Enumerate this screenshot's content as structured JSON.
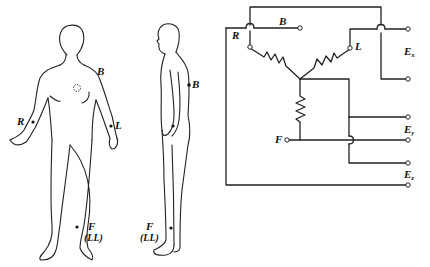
{
  "figure": {
    "front_view": {
      "labels": {
        "right_arm": "R",
        "left_arm": "L",
        "back": "B",
        "foot": "F",
        "foot_alt": "(LL)"
      }
    },
    "side_view": {
      "labels": {
        "back": "B",
        "foot": "F",
        "foot_alt": "(LL)"
      }
    },
    "circuit": {
      "nodes": {
        "right": "R",
        "back": "B",
        "left": "L",
        "foot": "F"
      },
      "outputs": [
        {
          "name": "E",
          "sub": "x"
        },
        {
          "name": "E",
          "sub": "y"
        },
        {
          "name": "E",
          "sub": "z"
        }
      ]
    }
  },
  "colors": {
    "ink": "#222222",
    "background": "#ffffff"
  }
}
